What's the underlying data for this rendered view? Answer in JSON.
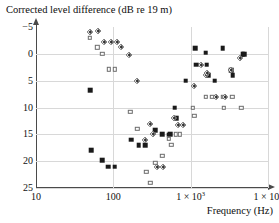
{
  "chart_data": {
    "type": "scatter",
    "title": "Corrected level difference (dB re 19 m)",
    "xlabel": "Frequency (Hz)",
    "ylabel": "Corrected level difference (dB re 19 m)",
    "xscale": "log",
    "xlim": [
      10,
      10000
    ],
    "ylim": [
      -5,
      25
    ],
    "y_inverted": true,
    "grid": true,
    "legend": "none",
    "xticks": [
      {
        "value": 10,
        "label": "10"
      },
      {
        "value": 100,
        "label": "100"
      },
      {
        "value": 1000,
        "label": "1 × 10",
        "exponent": "3"
      },
      {
        "value": 10000,
        "label": "1 × 10",
        "exponent": "4"
      }
    ],
    "yticks": [
      {
        "value": -5,
        "label": "−5"
      },
      {
        "value": 0,
        "label": "0"
      },
      {
        "value": 5,
        "label": "5"
      },
      {
        "value": 10,
        "label": "10"
      },
      {
        "value": 15,
        "label": "15"
      },
      {
        "value": 20,
        "label": "20"
      },
      {
        "value": 25,
        "label": "25"
      }
    ],
    "series": [
      {
        "name": "filled-square",
        "marker": "square-filled",
        "points": [
          [
            50,
            6.8
          ],
          [
            52,
            18.0
          ],
          [
            72,
            19.8
          ],
          [
            86,
            21.0
          ],
          [
            104,
            21.0
          ],
          [
            170,
            16.0
          ],
          [
            212,
            17.0
          ],
          [
            258,
            17.0
          ],
          [
            350,
            14.2
          ],
          [
            430,
            15.0
          ],
          [
            520,
            15.1
          ],
          [
            545,
            15.0
          ],
          [
            620,
            10.0
          ],
          [
            660,
            12.0
          ],
          [
            860,
            5.0
          ],
          [
            1150,
            -1.0
          ],
          [
            1180,
            2.0
          ],
          [
            1560,
            -0.2
          ],
          [
            1620,
            2.0
          ],
          [
            1700,
            4.0
          ],
          [
            2050,
            5.0
          ],
          [
            2600,
            -1.1
          ],
          [
            3350,
            3.0
          ],
          [
            3500,
            4.0
          ],
          [
            4700,
            0.1
          ],
          [
            4950,
            0.1
          ]
        ]
      },
      {
        "name": "open-square",
        "marker": "square-open",
        "points": [
          [
            50,
            -3.0
          ],
          [
            62,
            -1.2
          ],
          [
            72,
            0.0
          ],
          [
            88,
            2.9
          ],
          [
            104,
            2.9
          ],
          [
            166,
            10.8
          ],
          [
            204,
            14.0
          ],
          [
            266,
            22.0
          ],
          [
            300,
            24.0
          ],
          [
            350,
            20.3
          ],
          [
            430,
            19.0
          ],
          [
            520,
            15.8
          ],
          [
            560,
            17.0
          ],
          [
            640,
            15.0
          ],
          [
            720,
            15.0
          ],
          [
            1070,
            10.0
          ],
          [
            1120,
            11.5
          ],
          [
            1560,
            8.0
          ],
          [
            1900,
            8.0
          ],
          [
            2600,
            8.0
          ],
          [
            2700,
            10.0
          ],
          [
            3450,
            8.0
          ],
          [
            4500,
            10.0
          ]
        ]
      },
      {
        "name": "shaded-diamond",
        "marker": "diamond-shaded",
        "points": [
          [
            50,
            -4.0
          ],
          [
            64,
            -4.2
          ],
          [
            76,
            -2.2
          ],
          [
            92,
            -2.2
          ],
          [
            112,
            -2.2
          ],
          [
            125,
            -1.3
          ],
          [
            160,
            0.2
          ],
          [
            200,
            5.0
          ],
          [
            260,
            16.0
          ],
          [
            300,
            13.0
          ],
          [
            330,
            15.0
          ],
          [
            370,
            21.0
          ],
          [
            440,
            21.0
          ],
          [
            610,
            12.0
          ],
          [
            690,
            13.2
          ],
          [
            800,
            13.2
          ],
          [
            1100,
            6.0
          ],
          [
            1380,
            2.0
          ],
          [
            1580,
            4.0
          ],
          [
            1640,
            3.5
          ],
          [
            2100,
            8.0
          ],
          [
            2750,
            8.0
          ],
          [
            3300,
            3.0
          ],
          [
            4300,
            0.8
          ]
        ]
      }
    ]
  }
}
